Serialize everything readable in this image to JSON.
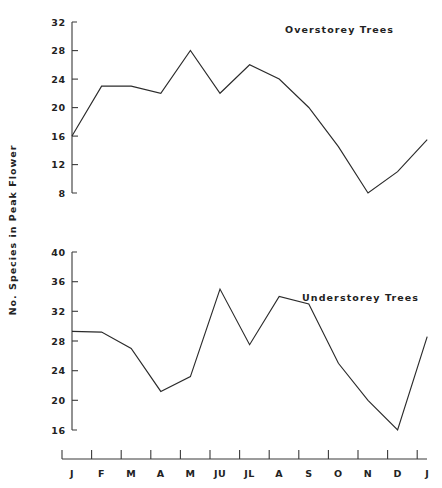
{
  "figure": {
    "ylabel": "No. Species in Peak Flower",
    "background": "#ffffff",
    "line_color": "#2b2b2b",
    "axis_color": "#3a3a3a"
  },
  "chart_data": [
    {
      "type": "line",
      "title": "Overstorey Trees",
      "xlabel": "",
      "ylabel": "No. Species in Peak Flower",
      "categories": [
        "J",
        "F",
        "M",
        "A",
        "M",
        "JU",
        "JL",
        "A",
        "S",
        "O",
        "N",
        "D",
        "J"
      ],
      "values": [
        16,
        23,
        23,
        22,
        28,
        22,
        26,
        24,
        20,
        14.5,
        8,
        11,
        15.5
      ],
      "yticks": [
        8,
        12,
        16,
        20,
        24,
        28,
        32
      ],
      "ylim": [
        8,
        32
      ],
      "grid": false,
      "legend": "none",
      "series": [
        {
          "name": "Overstorey Trees",
          "values": [
            16,
            23,
            23,
            22,
            28,
            22,
            26,
            24,
            20,
            14.5,
            8,
            11,
            15.5
          ]
        }
      ]
    },
    {
      "type": "line",
      "title": "Understorey Trees",
      "xlabel": "",
      "ylabel": "No. Species in Peak Flower",
      "categories": [
        "J",
        "F",
        "M",
        "A",
        "M",
        "JU",
        "JL",
        "A",
        "S",
        "O",
        "N",
        "D",
        "J"
      ],
      "values": [
        29.3,
        29.2,
        27,
        21.2,
        23.2,
        35,
        27.5,
        34,
        33,
        25,
        20,
        16,
        28.6
      ],
      "yticks": [
        16,
        20,
        24,
        28,
        32,
        36,
        40
      ],
      "ylim": [
        16,
        40
      ],
      "grid": false,
      "legend": "none",
      "series": [
        {
          "name": "Understorey Trees",
          "values": [
            29.3,
            29.2,
            27,
            21.2,
            23.2,
            35,
            27.5,
            34,
            33,
            25,
            20,
            16,
            28.6
          ]
        }
      ]
    }
  ]
}
